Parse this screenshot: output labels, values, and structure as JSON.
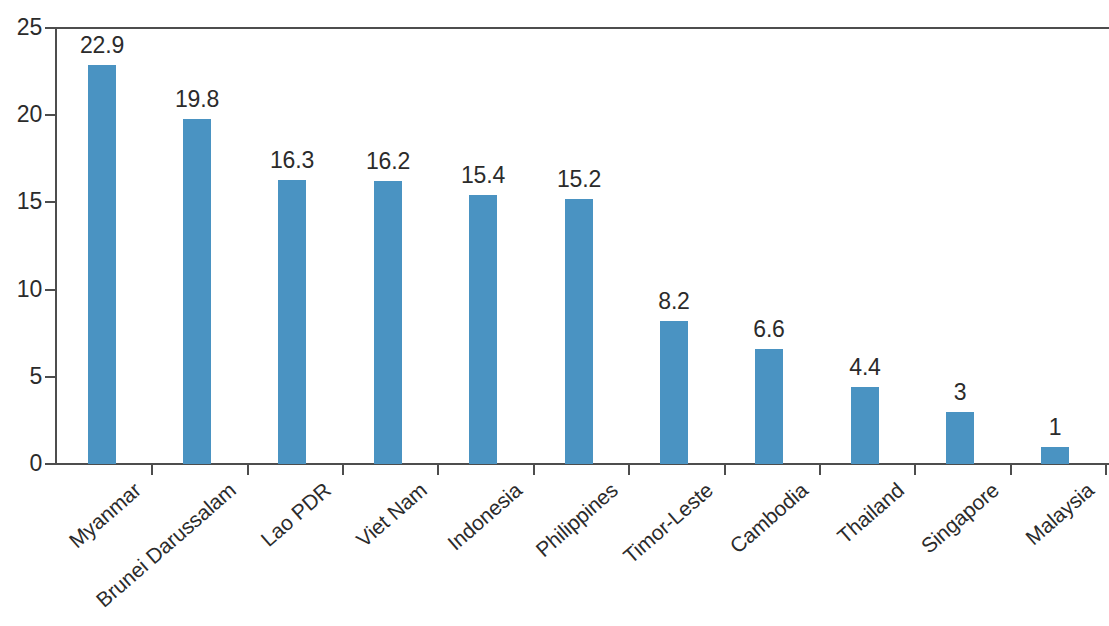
{
  "chart_data": {
    "type": "bar",
    "title": "",
    "subtitle": "",
    "xlabel": "",
    "ylabel": "",
    "categories": [
      "Myanmar",
      "Brunei Darussalam",
      "Lao PDR",
      "Viet Nam",
      "Indonesia",
      "Philippines",
      "Timor-Leste",
      "Cambodia",
      "Thailand",
      "Singapore",
      "Malaysia"
    ],
    "values": [
      22.9,
      19.8,
      16.3,
      16.2,
      15.4,
      15.2,
      8.2,
      6.6,
      4.4,
      3,
      1
    ],
    "value_labels": [
      "22.9",
      "19.8",
      "16.3",
      "16.2",
      "15.4",
      "15.2",
      "8.2",
      "6.6",
      "4.4",
      "3",
      "1"
    ],
    "ylim": [
      0,
      25
    ],
    "y_ticks": [
      0,
      5,
      10,
      15,
      20,
      25
    ],
    "y_tick_labels": [
      "0",
      "5",
      "10",
      "15",
      "20",
      "25"
    ],
    "grid": "top-only",
    "legend": "none",
    "bar_color": "#4a93c2",
    "axis_color": "#4d4d4d",
    "text_color": "#2b2b2b",
    "background_color": "#ffffff",
    "label_rotation_deg": -41
  }
}
